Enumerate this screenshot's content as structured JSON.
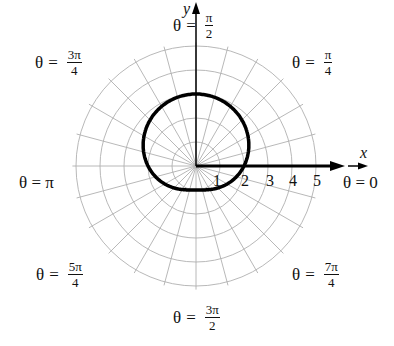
{
  "chart_data": {
    "type": "polar",
    "title": "",
    "curve": {
      "equation": "r = 2 + sin(θ)",
      "samples": [
        {
          "theta": "0",
          "r": 2
        },
        {
          "theta": "π/2",
          "r": 3
        },
        {
          "theta": "π",
          "r": 2
        },
        {
          "theta": "3π/2",
          "r": 1
        }
      ]
    },
    "radial_ticks": [
      "1",
      "2",
      "3",
      "4",
      "5"
    ],
    "rmax": 5,
    "axis_labels": {
      "x": "x",
      "y": "y"
    },
    "angle_labels": [
      {
        "key": "theta0",
        "text": "θ = 0"
      },
      {
        "key": "pi4",
        "num": "π",
        "den": "4"
      },
      {
        "key": "pi2",
        "num": "π",
        "den": "2"
      },
      {
        "key": "3pi4",
        "num": "3π",
        "den": "4"
      },
      {
        "key": "pi",
        "text": "θ = π"
      },
      {
        "key": "5pi4",
        "num": "5π",
        "den": "4"
      },
      {
        "key": "3pi2",
        "num": "3π",
        "den": "2"
      },
      {
        "key": "7pi4",
        "num": "7π",
        "den": "4"
      }
    ],
    "grid": true
  },
  "labels": {
    "theta": "θ",
    "eq": "=",
    "theta0": "θ = 0",
    "pi": "θ = π",
    "pi4": {
      "num": "π",
      "den": "4"
    },
    "pi2": {
      "num": "π",
      "den": "2"
    },
    "three_pi4": {
      "num": "3π",
      "den": "4"
    },
    "five_pi4": {
      "num": "5π",
      "den": "4"
    },
    "three_pi2": {
      "num": "3π",
      "den": "2"
    },
    "seven_pi4": {
      "num": "7π",
      "den": "4"
    },
    "x": "x",
    "y": "y",
    "ticks": [
      "1",
      "2",
      "3",
      "4",
      "5"
    ]
  }
}
